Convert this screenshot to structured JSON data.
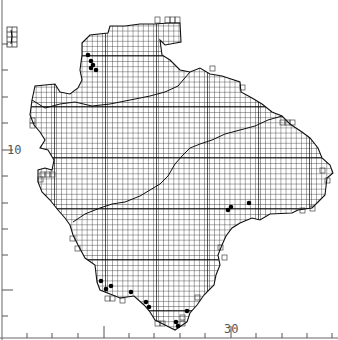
{
  "map": {
    "type": "distribution-grid-map",
    "axes": {
      "y_label": "10",
      "x_label": "30",
      "y_ticks_px": [
        44,
        70,
        97,
        123,
        150,
        176,
        203,
        229,
        255,
        290,
        316
      ],
      "x_ticks_px": [
        27,
        52,
        78,
        104,
        129,
        154,
        180,
        205,
        231,
        256,
        282,
        307,
        332
      ]
    },
    "colors": {
      "grid": "#2a2a2a",
      "outline": "#111111",
      "dots": "#000000",
      "axis": "#555555"
    },
    "grid_cell_px": 5.1,
    "record_dots": [
      [
        88,
        55
      ],
      [
        91,
        61
      ],
      [
        93,
        65
      ],
      [
        96,
        70
      ],
      [
        91,
        68
      ],
      [
        228,
        210
      ],
      [
        231,
        207
      ],
      [
        249,
        203
      ],
      [
        101,
        281
      ],
      [
        106,
        289
      ],
      [
        111,
        286
      ],
      [
        131,
        292
      ],
      [
        146,
        302
      ],
      [
        149,
        307
      ],
      [
        176,
        322
      ],
      [
        178,
        326
      ],
      [
        187,
        311
      ]
    ]
  }
}
